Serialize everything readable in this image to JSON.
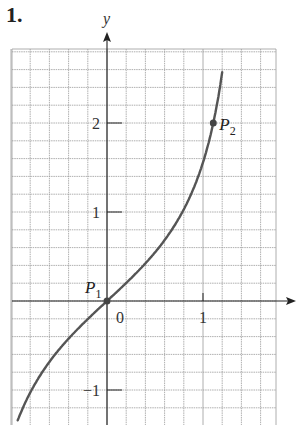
{
  "problem_number": "1.",
  "chart_data": {
    "type": "line",
    "title": "",
    "function": "y = tan(x)",
    "xlabel": "x",
    "ylabel": "y",
    "xlim": [
      -1.0,
      1.75
    ],
    "ylim": [
      -1.4,
      2.8
    ],
    "grid": true,
    "grid_step": 0.2,
    "x_ticks": [
      {
        "value": 0,
        "label": "0"
      },
      {
        "value": 1,
        "label": "1"
      }
    ],
    "y_ticks": [
      {
        "value": -1,
        "label": "−1"
      },
      {
        "value": 1,
        "label": "1"
      },
      {
        "value": 2,
        "label": "2"
      }
    ],
    "points": [
      {
        "name": "P",
        "sub": "1",
        "x": 0,
        "y": 0
      },
      {
        "name": "P",
        "sub": "2",
        "x": 1.107,
        "y": 2
      }
    ],
    "series": [
      {
        "name": "curve",
        "x": [
          -0.93,
          -0.785,
          -0.6,
          -0.4,
          -0.2,
          0,
          0.2,
          0.4,
          0.6,
          0.8,
          1.0,
          1.107,
          1.2
        ],
        "y": [
          -1.34,
          -1.0,
          -0.68,
          -0.42,
          -0.2,
          0,
          0.2,
          0.42,
          0.68,
          1.03,
          1.56,
          2.0,
          2.57
        ]
      }
    ],
    "colors": {
      "grid": "#9a9a9a",
      "axis": "#222222",
      "curve": "#555555",
      "point": "#444444"
    }
  }
}
